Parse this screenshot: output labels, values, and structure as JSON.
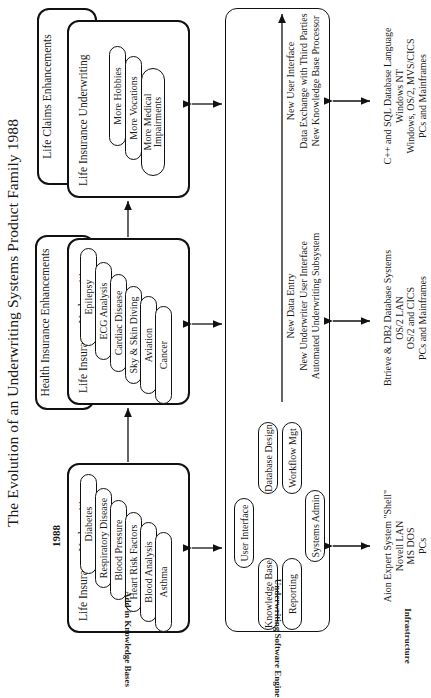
{
  "title": "The Evolution of an Underwriting Systems Product Family 1988",
  "row_labels": {
    "knowledge_bases": "Add-in Knowledge Bases",
    "engine": "Underwriting Software Engine",
    "infrastructure": "Infrastructure"
  },
  "stages": [
    {
      "year": "1988",
      "main_box": "Life Insurance Underwriting",
      "pills": [
        "Diabetes",
        "Respiratory Disease",
        "Blood Pressure",
        "Heart Risk Factors",
        "Blood Analysis",
        "Asthma"
      ]
    },
    {
      "year": "1991",
      "back_box": "Health Insurance Enhancements",
      "main_box": "Life Insurance Underwriting",
      "pills": [
        "Epilepsy",
        "ECG Analysis",
        "Cardiac Disease",
        "Sky & Skin Diving",
        "Aviation",
        "Cancer"
      ]
    },
    {
      "year": "1995",
      "back_box": "Life Claims Enhancements",
      "main_box": "Life Insurance Underwriting",
      "pills": [
        "More Hobbies",
        "More Vocations",
        "More Medical Impairments"
      ]
    }
  ],
  "engine": {
    "modules": [
      "User Interface",
      "Knowledge Base",
      "Reporting",
      "Database Design",
      "Workflow Mgt",
      "Systems Admin"
    ],
    "phase_1991": [
      "New Data Entry",
      "New Underwriter User Interface",
      "Automated Underwriting Subsystem"
    ],
    "phase_1995": [
      "New User Interface",
      "Data Exchange with Third Parties",
      "New Knowledge Base Processor"
    ]
  },
  "infrastructure": [
    {
      "lines": [
        "Aion Expert System \"Shell\"",
        "Novell LAN",
        "MS DOS",
        "PCs"
      ]
    },
    {
      "lines": [
        "Btrieve  &  DB2 Database Systems",
        "OS/2 LAN",
        "OS/2 and CICS",
        "PCs and Mainframes"
      ]
    },
    {
      "lines": [
        "C++ and SQL Database Language",
        "Windows NT",
        "Windows, OS/2, MVS/CICS",
        "PCs and Mainframes"
      ]
    }
  ]
}
